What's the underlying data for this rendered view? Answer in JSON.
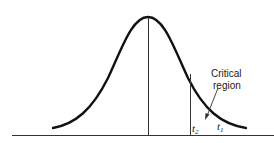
{
  "diagram": {
    "type": "normal-distribution-critical-region",
    "labels": {
      "critical_line1": "Critical",
      "critical_line2": "region",
      "t2_base": "t",
      "t2_sub": "2",
      "t1_base": "t",
      "t1_sub": "1"
    },
    "colors": {
      "curve": "#111111",
      "lines": "#333333",
      "background": "#ffffff"
    }
  }
}
